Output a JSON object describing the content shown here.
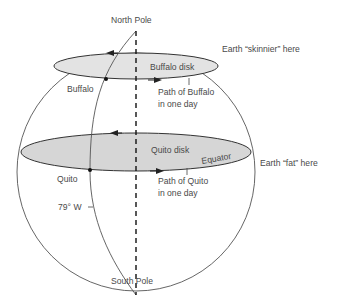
{
  "diagram": {
    "labels": {
      "north_pole": "North Pole",
      "south_pole": "South Pole",
      "skinnier": "Earth “skinnier” here",
      "fat": "Earth “fat” here",
      "buffalo_disk": "Buffalo disk",
      "buffalo": "Buffalo",
      "path_buffalo_1": "Path of Buffalo",
      "path_buffalo_2": "in one day",
      "quito_disk": "Quito disk",
      "equator": "Equator",
      "quito": "Quito",
      "path_quito_1": "Path of Quito",
      "path_quito_2": "in one day",
      "meridian": "79° W"
    },
    "colors": {
      "disk_fill": "#d6d6d6",
      "line": "#3a3a3a",
      "text": "#4a4a4a"
    }
  }
}
